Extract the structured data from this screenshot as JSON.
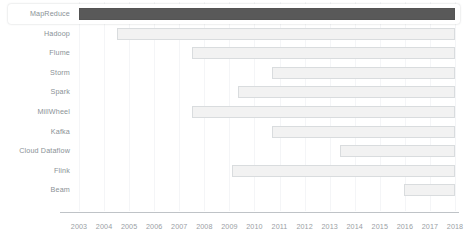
{
  "chart_data": {
    "type": "bar",
    "orientation": "horizontal",
    "subtype": "gantt-timeline",
    "title": "",
    "xlabel": "",
    "ylabel": "",
    "xlim": [
      2002.4,
      2018.6
    ],
    "grid": true,
    "legend": null,
    "xticks": [
      2003,
      2004,
      2005,
      2006,
      2007,
      2008,
      2009,
      2010,
      2011,
      2012,
      2013,
      2014,
      2015,
      2016,
      2017,
      2018
    ],
    "xtick_labels": [
      "2003",
      "2004",
      "2005",
      "2006",
      "2007",
      "2008",
      "2009",
      "2010",
      "2011",
      "2012",
      "2013",
      "2014",
      "2015",
      "2016",
      "2017",
      "2018"
    ],
    "categories": [
      "MapReduce",
      "Hadoop",
      "Flume",
      "Storm",
      "Spark",
      "MillWheel",
      "Kafka",
      "Cloud Dataflow",
      "Flink",
      "Beam"
    ],
    "colors": {
      "highlighted_bar": "#595959",
      "bar_fill": "#f2f2f2",
      "bar_border": "#d9dcde",
      "gridline": "#f4f5f7",
      "axis_line": "#bfc3c7",
      "label_text": "#8a9196",
      "tick_text": "#9aa0a5",
      "row_highlight": "#ffffff"
    },
    "bars": [
      {
        "label": "MapReduce",
        "start": 2003.0,
        "end": 2018.0,
        "highlighted": true,
        "row_selected": true
      },
      {
        "label": "Hadoop",
        "start": 2004.5,
        "end": 2018.0,
        "highlighted": false,
        "row_selected": false
      },
      {
        "label": "Flume",
        "start": 2007.5,
        "end": 2018.0,
        "highlighted": false,
        "row_selected": false
      },
      {
        "label": "Storm",
        "start": 2010.7,
        "end": 2018.0,
        "highlighted": false,
        "row_selected": false
      },
      {
        "label": "Spark",
        "start": 2009.35,
        "end": 2018.0,
        "highlighted": false,
        "row_selected": false
      },
      {
        "label": "MillWheel",
        "start": 2007.5,
        "end": 2018.0,
        "highlighted": false,
        "row_selected": false
      },
      {
        "label": "Kafka",
        "start": 2010.7,
        "end": 2018.0,
        "highlighted": false,
        "row_selected": false
      },
      {
        "label": "Cloud Dataflow",
        "start": 2013.4,
        "end": 2018.0,
        "highlighted": false,
        "row_selected": false
      },
      {
        "label": "Flink",
        "start": 2009.1,
        "end": 2018.0,
        "highlighted": false,
        "row_selected": false
      },
      {
        "label": "Beam",
        "start": 2015.95,
        "end": 2018.0,
        "highlighted": false,
        "row_selected": false
      }
    ]
  }
}
